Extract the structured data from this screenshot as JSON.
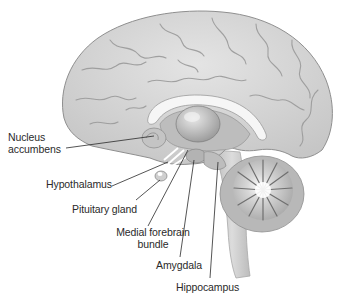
{
  "diagram": {
    "colors": {
      "background": "#ffffff",
      "cortex": "#d6d6d6",
      "cortex_shadow": "#a9a9a9",
      "corpus_callosum": "#f4f4f4",
      "thalamus": "#c4c4c4",
      "cerebellum": "#bdbdbd",
      "brainstem": "#cfcfcf",
      "leader_line": "#2a2a2a",
      "label_text": "#2a2a2a"
    },
    "labels": [
      {
        "id": "nucleus-accumbens",
        "lines": [
          "Nucleus",
          "accumbens"
        ],
        "text": "Nucleus accumbens"
      },
      {
        "id": "hypothalamus",
        "lines": [
          "Hypothalamus"
        ],
        "text": "Hypothalamus"
      },
      {
        "id": "pituitary-gland",
        "lines": [
          "Pituitary gland"
        ],
        "text": "Pituitary gland"
      },
      {
        "id": "medial-forebrain-bundle",
        "lines": [
          "Medial forebrain",
          "bundle"
        ],
        "text": "Medial forebrain bundle"
      },
      {
        "id": "amygdala",
        "lines": [
          "Amygdala"
        ],
        "text": "Amygdala"
      },
      {
        "id": "hippocampus",
        "lines": [
          "Hippocampus"
        ],
        "text": "Hippocampus"
      }
    ]
  }
}
